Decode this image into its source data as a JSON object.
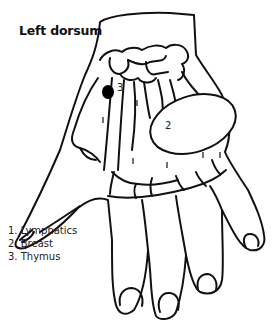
{
  "title": "Left dorsum",
  "legend": [
    {
      "number": "1.",
      "label": "Lymphatics"
    },
    {
      "number": "2.",
      "label": "Breast"
    },
    {
      "number": "3.",
      "label": "Thymus"
    }
  ],
  "zone_labels": {
    "thymus": "3",
    "breast": "2"
  },
  "colors": {
    "line": "#111111",
    "background": "#ffffff",
    "thymus_dot": "#000000"
  }
}
